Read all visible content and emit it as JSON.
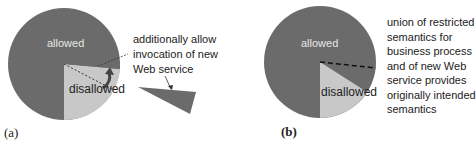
{
  "panel_a": {
    "label": "(a)",
    "allowed_label": "allowed",
    "disallowed_label": "disallowed",
    "annotation": [
      "additionally allow",
      "invocation of new",
      "Web service"
    ]
  },
  "panel_b": {
    "label": "(b)",
    "allowed_label": "allowed",
    "disallowed_label": "disallowed",
    "annotation": [
      "union of restricted",
      "semantics for",
      "business process",
      "and of new Web",
      "service provides",
      "originally intended",
      "semantics"
    ]
  },
  "colors": {
    "allowed": "#6b6b6b",
    "disallowed": "#c8c8c8",
    "text": "#222222"
  }
}
